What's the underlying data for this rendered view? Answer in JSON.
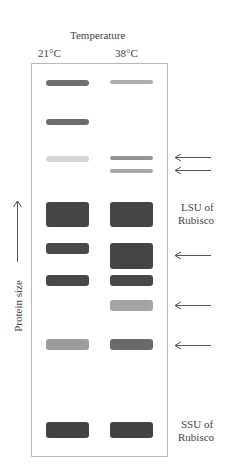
{
  "header": {
    "title": "Temperature",
    "lanes": [
      {
        "label": "21°C"
      },
      {
        "label": "38°C"
      }
    ]
  },
  "axis": {
    "label": "Protein size",
    "direction": "up"
  },
  "annotations": {
    "lsu": "LSU of\nRubisco",
    "lsu_line1": "LSU of",
    "lsu_line2": "Rubisco",
    "ssu_line1": "SSU of",
    "ssu_line2": "Rubisco"
  },
  "bands": [
    {
      "lane": 1,
      "top": 16,
      "height": 6,
      "color": "#6f6f6f"
    },
    {
      "lane": 2,
      "top": 16,
      "height": 4,
      "color": "#aeaeae"
    },
    {
      "lane": 1,
      "top": 55,
      "height": 6,
      "color": "#6c6c6c"
    },
    {
      "lane": 1,
      "top": 92,
      "height": 6,
      "color": "#d6d6d6"
    },
    {
      "lane": 2,
      "top": 92,
      "height": 4,
      "color": "#959595"
    },
    {
      "lane": 2,
      "top": 105,
      "height": 4,
      "color": "#a6a6a6"
    },
    {
      "lane": 1,
      "top": 138,
      "height": 25,
      "color": "#454545"
    },
    {
      "lane": 2,
      "top": 138,
      "height": 25,
      "color": "#454545"
    },
    {
      "lane": 1,
      "top": 179,
      "height": 11,
      "color": "#4a4a4a"
    },
    {
      "lane": 2,
      "top": 179,
      "height": 26,
      "color": "#454545"
    },
    {
      "lane": 1,
      "top": 211,
      "height": 11,
      "color": "#484848"
    },
    {
      "lane": 2,
      "top": 211,
      "height": 11,
      "color": "#484848"
    },
    {
      "lane": 2,
      "top": 236,
      "height": 11,
      "color": "#a4a4a4"
    },
    {
      "lane": 1,
      "top": 275,
      "height": 11,
      "color": "#9c9c9c"
    },
    {
      "lane": 2,
      "top": 275,
      "height": 11,
      "color": "#6a6a6a"
    },
    {
      "lane": 1,
      "top": 358,
      "height": 16,
      "color": "#434343"
    },
    {
      "lane": 2,
      "top": 358,
      "height": 16,
      "color": "#434343"
    }
  ],
  "arrows_y": [
    157,
    170,
    255,
    305,
    345
  ]
}
